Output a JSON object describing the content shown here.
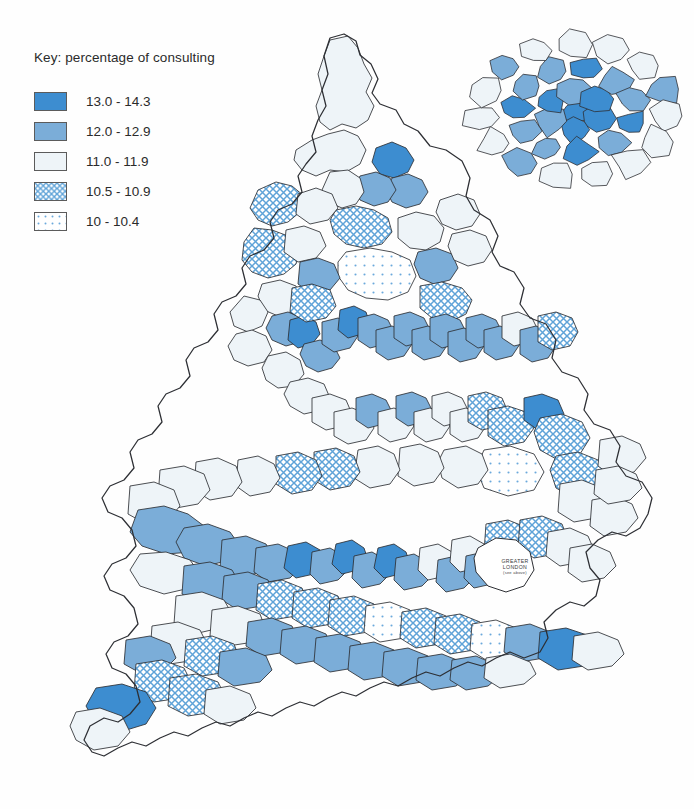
{
  "legend": {
    "title": "Key: percentage of consulting",
    "classes": [
      {
        "label": "13.0 - 14.3",
        "style": "solid",
        "color": "#3d8dd0",
        "name": "class-13-0-14-3"
      },
      {
        "label": "12.0 - 12.9",
        "style": "solid",
        "color": "#7badd8",
        "name": "class-12-0-12-9"
      },
      {
        "label": "11.0 - 11.9",
        "style": "solid",
        "color": "#eef4f8",
        "name": "class-11-0-11-9"
      },
      {
        "label": "10.5 - 10.9",
        "style": "crosshatch",
        "color": "#5fa3d8",
        "name": "class-10-5-10-9"
      },
      {
        "label": "10 - 10.4",
        "style": "dots",
        "color": "#6aa9dc",
        "name": "class-10-10-4"
      }
    ]
  },
  "inset": {
    "name": "greater-london-inset",
    "callout": {
      "line1": "GREATER",
      "line2": "LONDON",
      "line3": "(see above)"
    }
  },
  "chart_data": {
    "type": "choropleth",
    "title": "Key: percentage of consulting",
    "unit": "percent",
    "region_label": "England and Wales, district health areas",
    "legend_position": "top-left",
    "inset_label": "GREATER LONDON (see above)",
    "classes": [
      {
        "label": "13.0 - 14.3",
        "min": 13.0,
        "max": 14.3,
        "fill": "#3d8dd0",
        "pattern": "solid"
      },
      {
        "label": "12.0 - 12.9",
        "min": 12.0,
        "max": 12.9,
        "fill": "#7badd8",
        "pattern": "solid"
      },
      {
        "label": "11.0 - 11.9",
        "min": 11.0,
        "max": 11.9,
        "fill": "#eef4f8",
        "pattern": "solid"
      },
      {
        "label": "10.5 - 10.9",
        "min": 10.5,
        "max": 10.9,
        "fill": "#5fa3d8",
        "pattern": "crosshatch"
      },
      {
        "label": "10 - 10.4",
        "min": 10.0,
        "max": 10.4,
        "fill": "#6aa9dc",
        "pattern": "dots"
      }
    ],
    "value_range": [
      10.0,
      14.3
    ],
    "n_classes": 5
  },
  "map": {
    "name": "england-wales-choropleth",
    "viewbox": "0 0 694 809",
    "coast_outline": "M330,38 L344,34 L356,41 L360,55 L371,64 L378,79 L372,93 L380,104 L396,110 L404,124 L418,131 L430,146 L446,150 L462,161 L470,178 L466,196 L474,210 L490,220 L498,236 L492,252 L500,266 L514,272 L524,288 L520,304 L530,318 L546,324 L556,340 L552,358 L562,372 L578,378 L588,394 L584,410 L594,424 L610,430 L620,446 L616,462 L626,476 L642,482 L652,498 L648,514 L640,528 L626,536 L612,532 L598,540 L586,552 L590,568 L600,580 L596,596 L584,606 L570,602 L556,610 L544,622 L548,638 L540,652 L524,658 L510,652 L496,658 L482,666 L468,662 L454,668 L440,676 L426,672 L412,678 L398,686 L384,682 L370,688 L356,696 L342,692 L328,698 L314,706 L300,702 L286,708 L272,716 L258,712 L244,718 L230,726 L216,722 L202,728 L188,736 L174,732 L160,738 L146,746 L132,742 L118,748 L104,756 L92,752 L84,740 L90,726 L104,718 L118,722 L130,714 L140,702 L136,686 L126,674 L112,668 L106,654 L114,642 L128,636 L138,624 L134,608 L124,596 L110,590 L104,576 L112,564 L126,558 L136,546 L132,530 L122,518 L108,512 L102,498 L110,486 L124,480 L134,468 L130,452 L138,440 L152,434 L162,422 L158,406 L166,394 L180,388 L190,376 L186,360 L194,348 L208,342 L218,330 L214,314 L222,302 L236,296 L246,284 L242,268 L250,256 L264,250 L274,238 L270,222 L278,210 L292,204 L302,192 L298,176 L306,164 L316,152 L312,136 L318,120 L326,106 L322,90 L328,74 L324,56 Z",
    "regions": [
      {
        "cls": 2,
        "d": "M330,40 L348,36 L358,48 L364,64 L372,78 L366,92 L374,106 L368,120 L356,128 L342,124 L330,130 L320,122 L316,106 L322,90 L318,74 L324,56 Z"
      },
      {
        "cls": 2,
        "d": "M296,150 L312,140 L328,134 L344,130 L358,136 L366,150 L360,164 L346,172 L330,170 L316,176 L302,170 L294,160 Z"
      },
      {
        "cls": 3,
        "d": "M258,190 L276,182 L292,186 L304,196 L300,212 L288,222 L272,226 L258,220 L250,208 Z"
      },
      {
        "cls": 3,
        "d": "M254,228 L272,230 L288,236 L300,248 L296,264 L284,274 L268,278 L252,272 L242,260 L244,242 Z"
      },
      {
        "cls": 0,
        "d": "M376,148 L392,142 L406,148 L414,160 L408,172 L394,178 L380,174 L372,162 Z"
      },
      {
        "cls": 1,
        "d": "M392,178 L408,174 L422,180 L428,192 L420,204 L406,208 L392,202 L386,190 Z"
      },
      {
        "cls": 1,
        "d": "M360,176 L376,172 L390,178 L396,190 L388,202 L374,206 L360,200 L354,188 Z"
      },
      {
        "cls": 2,
        "d": "M330,172 L348,170 L360,178 L364,192 L356,204 L342,208 L328,202 L322,190 Z"
      },
      {
        "cls": 3,
        "d": "M336,210 L356,206 L374,210 L388,218 L392,232 L382,244 L364,248 L346,244 L334,234 L330,220 Z"
      },
      {
        "cls": 4,
        "d": "M346,252 L370,248 L392,252 L410,260 L416,276 L408,292 L388,300 L366,298 L348,290 L338,276 L338,262 Z"
      },
      {
        "cls": 2,
        "d": "M398,218 L416,212 L434,216 L444,228 L440,242 L426,250 L410,248 L398,238 Z"
      },
      {
        "cls": 1,
        "d": "M418,252 L436,248 L452,254 L458,268 L450,280 L434,284 L420,278 L414,264 Z"
      },
      {
        "cls": 3,
        "d": "M420,286 L442,282 L462,288 L472,300 L466,314 L450,322 L432,318 L420,308 Z"
      },
      {
        "cls": 2,
        "d": "M440,200 L458,194 L474,200 L480,214 L472,226 L456,230 L442,224 L436,212 Z"
      },
      {
        "cls": 2,
        "d": "M452,234 L470,230 L486,236 L492,250 L484,262 L468,266 L454,260 L448,246 Z"
      },
      {
        "cls": 2,
        "d": "M262,284 L280,280 L296,286 L302,300 L294,312 L278,316 L264,310 L258,296 Z"
      },
      {
        "cls": 2,
        "d": "M244,296 L260,300 L268,312 L262,326 L248,332 L234,326 L230,312 Z"
      },
      {
        "cls": 2,
        "d": "M236,334 L252,330 L266,336 L272,350 L264,362 L248,366 L234,360 L228,346 Z"
      },
      {
        "cls": 1,
        "d": "M272,316 L288,312 L302,318 L308,330 L300,342 L286,346 L272,340 L266,328 Z"
      },
      {
        "cls": 0,
        "d": "M290,320 L304,316 L316,322 L320,334 L312,344 L298,348 L288,340 Z"
      },
      {
        "cls": 1,
        "d": "M304,344 L320,340 L334,346 L340,358 L332,368 L318,372 L306,366 L300,354 Z"
      },
      {
        "cls": 1,
        "d": "M322,322 L338,318 L352,324 L358,336 L350,348 L334,352 L322,344 Z"
      },
      {
        "cls": 0,
        "d": "M340,310 L354,306 L366,312 L370,324 L362,334 L348,338 L338,330 Z"
      },
      {
        "cls": 1,
        "d": "M358,318 L374,314 L388,320 L394,332 L386,344 L370,348 L358,340 Z"
      },
      {
        "cls": 1,
        "d": "M376,330 L392,326 L406,332 L412,344 L404,356 L388,360 L376,352 Z"
      },
      {
        "cls": 1,
        "d": "M394,316 L410,312 L424,318 L430,330 L422,342 L406,346 L394,338 Z"
      },
      {
        "cls": 1,
        "d": "M412,330 L428,326 L442,332 L448,344 L440,356 L424,360 L412,352 Z"
      },
      {
        "cls": 1,
        "d": "M430,318 L446,314 L460,320 L466,332 L458,344 L442,348 L430,340 Z"
      },
      {
        "cls": 1,
        "d": "M448,332 L464,328 L478,334 L484,346 L476,358 L460,362 L448,354 Z"
      },
      {
        "cls": 1,
        "d": "M466,318 L482,314 L496,320 L502,332 L494,344 L478,348 L466,340 Z"
      },
      {
        "cls": 1,
        "d": "M484,330 L500,326 L514,332 L520,344 L512,356 L496,360 L484,352 Z"
      },
      {
        "cls": 2,
        "d": "M502,316 L518,312 L532,318 L538,330 L530,342 L514,346 L502,338 Z"
      },
      {
        "cls": 1,
        "d": "M520,330 L536,326 L550,332 L556,346 L548,358 L532,362 L520,354 Z"
      },
      {
        "cls": 3,
        "d": "M538,316 L556,312 L572,318 L578,332 L570,346 L552,350 L538,342 Z"
      },
      {
        "cls": 2,
        "d": "M268,356 L286,352 L300,360 L304,374 L294,386 L278,388 L266,380 L262,368 Z"
      },
      {
        "cls": 2,
        "d": "M290,382 L308,378 L324,384 L330,398 L322,410 L304,414 L290,406 L284,394 Z"
      },
      {
        "cls": 2,
        "d": "M312,398 L330,394 L346,400 L352,414 L344,426 L326,430 L312,422 Z"
      },
      {
        "cls": 2,
        "d": "M334,412 L352,408 L368,414 L374,428 L366,440 L348,444 L334,436 Z"
      },
      {
        "cls": 1,
        "d": "M356,398 L372,394 L386,400 L392,412 L384,424 L368,428 L356,420 Z"
      },
      {
        "cls": 2,
        "d": "M378,412 L394,408 L408,414 L414,426 L406,438 L390,442 L378,434 Z"
      },
      {
        "cls": 1,
        "d": "M396,396 L412,392 L426,398 L432,410 L424,422 L408,426 L396,418 Z"
      },
      {
        "cls": 2,
        "d": "M414,412 L430,408 L444,414 L450,426 L442,438 L426,442 L414,434 Z"
      },
      {
        "cls": 2,
        "d": "M432,396 L448,392 L462,398 L468,410 L460,422 L444,426 L432,418 Z"
      },
      {
        "cls": 2,
        "d": "M450,412 L466,408 L480,414 L486,426 L478,438 L462,442 L450,434 Z"
      },
      {
        "cls": 3,
        "d": "M468,396 L486,392 L502,398 L508,412 L500,426 L482,430 L468,422 Z"
      },
      {
        "cls": 3,
        "d": "M488,410 L508,406 L526,412 L534,428 L524,442 L504,446 L488,436 Z"
      },
      {
        "cls": 0,
        "d": "M524,398 L542,394 L558,400 L564,414 L556,426 L538,430 L524,420 Z"
      },
      {
        "cls": 3,
        "d": "M540,418 L562,414 L582,422 L590,438 L580,454 L558,460 L540,450 L534,432 Z"
      },
      {
        "cls": 3,
        "d": "M556,456 L578,452 L598,460 L606,476 L596,492 L574,498 L556,488 L550,470 Z"
      },
      {
        "cls": 4,
        "d": "M484,450 L510,446 L534,454 L544,472 L534,490 L508,496 L484,488 L476,468 Z"
      },
      {
        "cls": 2,
        "d": "M444,450 L466,446 L482,454 L488,470 L478,484 L458,488 L442,478 L438,462 Z"
      },
      {
        "cls": 2,
        "d": "M400,448 L420,444 L438,452 L444,468 L434,482 L414,486 L398,476 Z"
      },
      {
        "cls": 2,
        "d": "M358,450 L378,446 L394,454 L400,470 L390,484 L370,488 L354,478 Z"
      },
      {
        "cls": 3,
        "d": "M314,452 L336,448 L354,456 L360,472 L350,486 L330,490 L314,480 Z"
      },
      {
        "cls": 3,
        "d": "M276,456 L298,452 L316,460 L322,476 L312,490 L292,494 L276,484 Z"
      },
      {
        "cls": 2,
        "d": "M238,460 L258,456 L274,464 L280,478 L270,492 L250,496 L236,486 Z"
      },
      {
        "cls": 2,
        "d": "M196,462 L218,458 L236,466 L242,482 L232,496 L210,500 L194,490 Z"
      },
      {
        "cls": 2,
        "d": "M160,470 L184,466 L204,474 L210,490 L198,504 L176,508 L158,498 Z"
      },
      {
        "cls": 2,
        "d": "M130,486 L154,482 L174,490 L180,506 L168,520 L146,524 L128,514 Z"
      },
      {
        "cls": 1,
        "d": "M138,510 L164,506 L188,514 L204,526 L208,542 L192,552 L166,554 L142,546 L130,532 Z"
      },
      {
        "cls": 1,
        "d": "M184,528 L208,524 L230,532 L240,546 L230,560 L206,566 L184,558 L176,542 Z"
      },
      {
        "cls": 1,
        "d": "M222,540 L246,536 L266,544 L274,558 L262,572 L238,578 L220,568 Z"
      },
      {
        "cls": 1,
        "d": "M256,548 L278,544 L296,552 L302,566 L290,578 L268,582 L254,572 Z"
      },
      {
        "cls": 0,
        "d": "M288,546 L306,542 L320,550 L324,564 L314,574 L296,578 L284,568 Z"
      },
      {
        "cls": 1,
        "d": "M312,552 L330,548 L344,556 L348,570 L338,580 L320,584 L310,574 Z"
      },
      {
        "cls": 0,
        "d": "M336,544 L352,540 L364,548 L368,560 L358,570 L342,574 L332,564 Z"
      },
      {
        "cls": 1,
        "d": "M354,556 L372,552 L386,560 L390,574 L380,584 L362,588 L352,578 Z"
      },
      {
        "cls": 0,
        "d": "M378,548 L394,544 L406,552 L410,564 L400,574 L384,578 L374,568 Z"
      },
      {
        "cls": 1,
        "d": "M396,558 L414,554 L428,562 L432,576 L422,586 L404,590 L394,580 Z"
      },
      {
        "cls": 2,
        "d": "M420,548 L438,544 L452,552 L456,566 L446,576 L428,580 L418,570 Z"
      },
      {
        "cls": 1,
        "d": "M438,560 L456,556 L470,564 L474,578 L464,588 L446,592 L436,582 Z"
      },
      {
        "cls": 2,
        "d": "M452,540 L470,536 L484,544 L488,558 L478,568 L460,572 L450,562 Z"
      },
      {
        "cls": 1,
        "d": "M466,556 L484,552 L498,560 L502,574 L492,584 L474,588 L464,578 Z"
      },
      {
        "cls": 3,
        "d": "M486,524 L508,520 L528,528 L534,544 L522,558 L500,562 L484,552 Z"
      },
      {
        "cls": 3,
        "d": "M520,520 L542,516 L562,524 L568,540 L556,554 L534,558 L518,548 Z"
      },
      {
        "cls": 2,
        "d": "M548,532 L570,528 L588,536 L594,550 L582,562 L560,566 L546,556 Z"
      },
      {
        "cls": 2,
        "d": "M570,548 L592,544 L610,552 L616,566 L604,578 L582,582 L568,572 Z"
      },
      {
        "cls": 2,
        "d": "M560,484 L582,480 L602,488 L608,504 L596,518 L574,522 L558,512 Z"
      },
      {
        "cls": 2,
        "d": "M592,500 L614,496 L632,504 L638,518 L626,532 L604,536 L590,526 Z"
      },
      {
        "cls": 2,
        "d": "M600,440 L622,436 L640,444 L646,458 L634,472 L612,476 L598,466 Z"
      },
      {
        "cls": 2,
        "d": "M596,470 L618,466 L636,474 L642,488 L630,500 L608,504 L594,494 Z"
      },
      {
        "cls": 2,
        "d": "M140,554 L166,552 L190,560 L200,574 L190,588 L164,594 L140,586 L130,570 Z"
      },
      {
        "cls": 1,
        "d": "M184,566 L210,562 L232,570 L240,584 L228,598 L202,604 L182,594 Z"
      },
      {
        "cls": 1,
        "d": "M224,576 L248,572 L268,580 L274,594 L262,606 L238,610 L222,600 Z"
      },
      {
        "cls": 3,
        "d": "M258,584 L282,580 L302,588 L308,604 L296,616 L272,620 L256,610 Z"
      },
      {
        "cls": 3,
        "d": "M294,592 L318,588 L338,596 L344,612 L332,624 L308,628 L292,618 Z"
      },
      {
        "cls": 3,
        "d": "M330,600 L354,596 L374,604 L380,620 L368,632 L344,636 L328,626 Z"
      },
      {
        "cls": 4,
        "d": "M366,606 L390,602 L410,610 L416,626 L404,638 L380,642 L364,632 Z"
      },
      {
        "cls": 3,
        "d": "M402,612 L426,608 L446,616 L452,632 L440,644 L416,648 L400,638 Z"
      },
      {
        "cls": 3,
        "d": "M436,618 L460,614 L480,622 L486,638 L474,650 L450,654 L434,644 Z"
      },
      {
        "cls": 4,
        "d": "M472,624 L496,620 L516,628 L522,644 L510,656 L486,660 L470,650 Z"
      },
      {
        "cls": 1,
        "d": "M506,628 L530,624 L550,632 L556,646 L544,658 L520,662 L504,652 Z"
      },
      {
        "cls": 0,
        "d": "M540,632 L566,628 L590,636 L598,652 L584,666 L558,670 L538,658 Z"
      },
      {
        "cls": 2,
        "d": "M574,636 L598,632 L618,640 L624,654 L612,666 L588,670 L572,660 Z"
      },
      {
        "cls": 2,
        "d": "M176,596 L202,592 L224,600 L232,614 L220,628 L194,634 L174,624 Z"
      },
      {
        "cls": 2,
        "d": "M212,610 L238,606 L260,614 L266,630 L254,642 L228,646 L210,636 Z"
      },
      {
        "cls": 1,
        "d": "M248,622 L272,618 L292,626 L298,640 L286,652 L262,656 L246,646 Z"
      },
      {
        "cls": 1,
        "d": "M282,630 L306,626 L326,634 L332,648 L320,660 L296,664 L280,654 Z"
      },
      {
        "cls": 1,
        "d": "M316,638 L340,634 L360,642 L366,656 L354,668 L330,672 L314,662 Z"
      },
      {
        "cls": 1,
        "d": "M350,646 L374,642 L394,650 L400,664 L388,676 L364,680 L348,670 Z"
      },
      {
        "cls": 1,
        "d": "M384,652 L408,648 L428,656 L434,670 L422,682 L398,686 L382,676 Z"
      },
      {
        "cls": 1,
        "d": "M418,658 L442,654 L462,662 L468,676 L456,686 L432,690 L416,680 Z"
      },
      {
        "cls": 1,
        "d": "M452,660 L476,656 L494,664 L500,676 L488,686 L466,690 L450,680 Z"
      },
      {
        "cls": 2,
        "d": "M486,658 L510,654 L530,662 L536,674 L524,684 L500,688 L484,678 Z"
      },
      {
        "cls": 2,
        "d": "M152,626 L178,622 L200,630 L208,646 L196,660 L170,664 L150,654 Z"
      },
      {
        "cls": 3,
        "d": "M186,640 L212,636 L234,644 L240,660 L228,672 L202,676 L184,666 Z"
      },
      {
        "cls": 1,
        "d": "M220,652 L246,648 L266,656 L272,670 L260,682 L234,686 L218,676 Z"
      },
      {
        "cls": 1,
        "d": "M126,640 L150,636 L170,644 L176,658 L164,670 L142,674 L124,664 Z"
      },
      {
        "cls": 3,
        "d": "M136,664 L162,660 L184,668 L192,684 L180,698 L154,702 L134,692 Z"
      },
      {
        "cls": 3,
        "d": "M170,678 L196,674 L218,682 L226,698 L214,712 L188,716 L168,706 Z"
      },
      {
        "cls": 0,
        "d": "M96,688 L122,684 L146,692 L156,708 L146,724 L120,732 L96,724 L86,706 Z"
      },
      {
        "cls": 2,
        "d": "M76,712 L100,708 L122,716 L130,732 L118,746 L94,750 L76,740 L70,726 Z"
      },
      {
        "cls": 2,
        "d": "M206,690 L230,686 L250,694 L256,708 L244,720 L220,724 L204,714 Z"
      },
      {
        "cls": 2,
        "d": "M298,194 L316,188 L332,194 L338,208 L328,220 L310,224 L296,214 Z"
      },
      {
        "cls": 2,
        "d": "M286,230 L304,226 L320,232 L326,246 L316,258 L298,262 L284,252 Z"
      },
      {
        "cls": 1,
        "d": "M300,262 L318,258 L334,264 L340,278 L330,290 L312,294 L298,284 Z"
      },
      {
        "cls": 3,
        "d": "M292,288 L312,284 L330,290 L336,306 L326,318 L306,322 L290,312 Z"
      }
    ]
  }
}
